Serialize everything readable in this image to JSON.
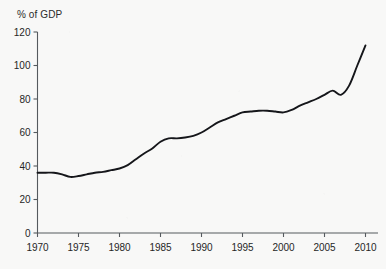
{
  "chart_data": {
    "type": "line",
    "title": "",
    "subtitle": "",
    "xlabel": "",
    "ylabel": "% of GDP",
    "xlim": [
      1970,
      2011
    ],
    "ylim": [
      0,
      120
    ],
    "grid": false,
    "legend": false,
    "legend_position": "none",
    "y_ticks": [
      0,
      20,
      40,
      60,
      80,
      100,
      120
    ],
    "y_tick_labels": [
      "0",
      "20",
      "40",
      "60",
      "80",
      "100",
      "120"
    ],
    "x_ticks": [
      1970,
      1975,
      1980,
      1985,
      1990,
      1995,
      2000,
      2005,
      2010
    ],
    "x_tick_labels": [
      "1970",
      "1975",
      "1980",
      "1985",
      "1990",
      "1995",
      "2000",
      "2005",
      "2010"
    ],
    "x": [
      1970,
      1971,
      1972,
      1973,
      1974,
      1975,
      1976,
      1977,
      1978,
      1979,
      1980,
      1981,
      1982,
      1983,
      1984,
      1985,
      1986,
      1987,
      1988,
      1989,
      1990,
      1991,
      1992,
      1993,
      1994,
      1995,
      1996,
      1997,
      1998,
      1999,
      2000,
      2001,
      2002,
      2003,
      2004,
      2005,
      2006,
      2007,
      2008,
      2009,
      2010
    ],
    "values": [
      36,
      36,
      36,
      35,
      33.5,
      34,
      35,
      36,
      36.5,
      37.5,
      38.5,
      40.5,
      44,
      47.5,
      50.5,
      54.5,
      56.5,
      56.5,
      57,
      58,
      60,
      63,
      66,
      68,
      70,
      72,
      72.5,
      73,
      73,
      72.5,
      72,
      73.5,
      76,
      78,
      80,
      82.5,
      85,
      82.5,
      88,
      100,
      112
    ],
    "series": [
      {
        "name": "Debt",
        "color": "#15161a",
        "values": [
          36,
          36,
          36,
          35,
          33.5,
          34,
          35,
          36,
          36.5,
          37.5,
          38.5,
          40.5,
          44,
          47.5,
          50.5,
          54.5,
          56.5,
          56.5,
          57,
          58,
          60,
          63,
          66,
          68,
          70,
          72,
          72.5,
          73,
          73,
          72.5,
          72,
          73.5,
          76,
          78,
          80,
          82.5,
          85,
          82.5,
          88,
          100,
          112
        ]
      }
    ],
    "annotations": []
  },
  "colors": {
    "background": "#f8f8f7",
    "line": "#15161a",
    "axis": "#555a5e",
    "text": "#262626"
  }
}
